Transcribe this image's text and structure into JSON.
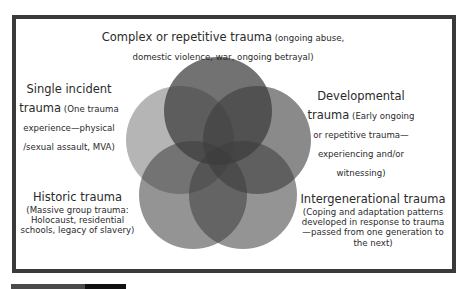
{
  "diagram": {
    "type": "venn-flower",
    "circle_fill": "#3c3c3c",
    "border_color": "#3a3a3a",
    "circles": [
      {
        "id": "complex",
        "cx": 218,
        "cy": 111,
        "r": 54,
        "opacity": 0.72
      },
      {
        "id": "single",
        "cx": 180,
        "cy": 140,
        "r": 54,
        "opacity": 0.38
      },
      {
        "id": "developmental",
        "cx": 257,
        "cy": 140,
        "r": 54,
        "opacity": 0.6
      },
      {
        "id": "historic",
        "cx": 193,
        "cy": 195,
        "r": 54,
        "opacity": 0.55
      },
      {
        "id": "intergenerational",
        "cx": 243,
        "cy": 195,
        "r": 54,
        "opacity": 0.55
      }
    ],
    "labels": {
      "complex": {
        "title": "Complex or repetitive trauma",
        "desc": " (ongoing abuse, domestic violence, war, ongoing betrayal)"
      },
      "single": {
        "title_line1": "Single incident",
        "title_line2": "trauma",
        "desc": " (One trauma experience—physical /sexual assault, MVA)"
      },
      "developmental": {
        "title_line1": "Developmental",
        "title_line2": "trauma",
        "desc": " (Early ongoing or repetitive trauma—experiencing and/or witnessing)"
      },
      "historic": {
        "title": "Historic trauma",
        "desc": "(Massive group trauma: Holocaust, residential schools, legacy of slavery)"
      },
      "intergenerational": {
        "title": "Intergenerational trauma",
        "desc": "(Coping and adaptation patterns developed in response to trauma—passed from one generation to the next)"
      }
    }
  }
}
